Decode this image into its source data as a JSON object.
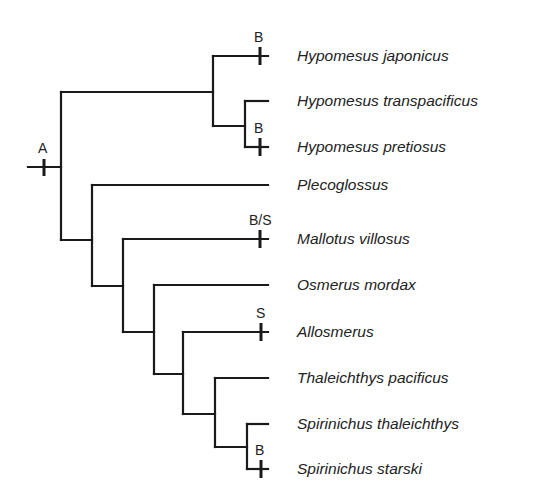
{
  "diagram": {
    "type": "phylogenetic-tree",
    "taxa": [
      {
        "name": "Hypomesus japonicus",
        "y": 56,
        "marker": "B"
      },
      {
        "name": "Hypomesus transpacificus",
        "y": 101,
        "marker": ""
      },
      {
        "name": "Hypomesus pretiosus",
        "y": 147,
        "marker": "B"
      },
      {
        "name": "Plecoglossus",
        "y": 185,
        "marker": ""
      },
      {
        "name": "Mallotus villosus",
        "y": 239,
        "marker": "B/S"
      },
      {
        "name": "Osmerus mordax",
        "y": 285,
        "marker": ""
      },
      {
        "name": "Allosmerus",
        "y": 332,
        "marker": "S"
      },
      {
        "name": "Thaleichthys pacificus",
        "y": 378,
        "marker": ""
      },
      {
        "name": "Spirinichus thaleichthys",
        "y": 424,
        "marker": ""
      },
      {
        "name": "Spirinichus starski",
        "y": 469,
        "marker": "B"
      }
    ],
    "root_marker": "A",
    "markers": {
      "root": "A",
      "japonicus": "B",
      "pretiosus": "B",
      "mallotus": "B/S",
      "allosmerus": "S",
      "starski": "B"
    }
  }
}
